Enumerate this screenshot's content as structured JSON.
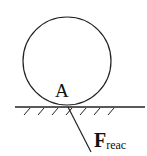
{
  "diagram": {
    "point_label": "A",
    "force_label": "F",
    "force_subscript": "reac",
    "stroke_color": "#222222"
  }
}
